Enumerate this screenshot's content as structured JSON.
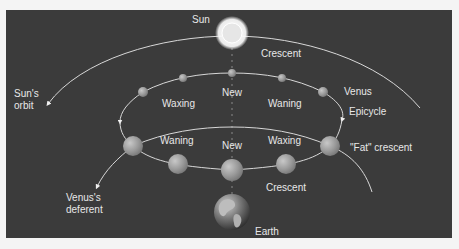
{
  "diagram": {
    "colors": {
      "background": "#3b3b3b",
      "page": "#f4f4f4",
      "orbit_line": "#d8d8d8",
      "label_text": "#e8e8e8",
      "venus_fill": "#9a9a9a",
      "sun_glow": "#ffffff"
    },
    "labels": {
      "sun": "Sun",
      "sun_orbit_line1": "Sun's",
      "sun_orbit_line2": "orbit",
      "crescent_top": "Crescent",
      "waxing_upper": "Waxing",
      "new_upper": "New",
      "waning_upper": "Waning",
      "venus": "Venus",
      "epicycle": "Epicycle",
      "waning_lower": "Waning",
      "new_lower": "New",
      "waxing_lower": "Waxing",
      "fat_crescent": "\"Fat\" crescent",
      "crescent_bottom": "Crescent",
      "venus_deferent_line1": "Venus's",
      "venus_deferent_line2": "deferent",
      "earth": "Earth"
    },
    "bodies": {
      "sun": {
        "x": 232,
        "y": 33,
        "r": 13
      },
      "earth": {
        "x": 232,
        "y": 212,
        "r": 18
      },
      "venus_positions": [
        {
          "x": 143,
          "y": 92,
          "r": 5
        },
        {
          "x": 183,
          "y": 78,
          "r": 4
        },
        {
          "x": 232,
          "y": 73,
          "r": 4
        },
        {
          "x": 282,
          "y": 78,
          "r": 4
        },
        {
          "x": 323,
          "y": 92,
          "r": 5
        },
        {
          "x": 133,
          "y": 146,
          "r": 10
        },
        {
          "x": 178,
          "y": 164,
          "r": 10
        },
        {
          "x": 232,
          "y": 170,
          "r": 11
        },
        {
          "x": 286,
          "y": 164,
          "r": 10
        },
        {
          "x": 330,
          "y": 146,
          "r": 10
        }
      ]
    }
  }
}
